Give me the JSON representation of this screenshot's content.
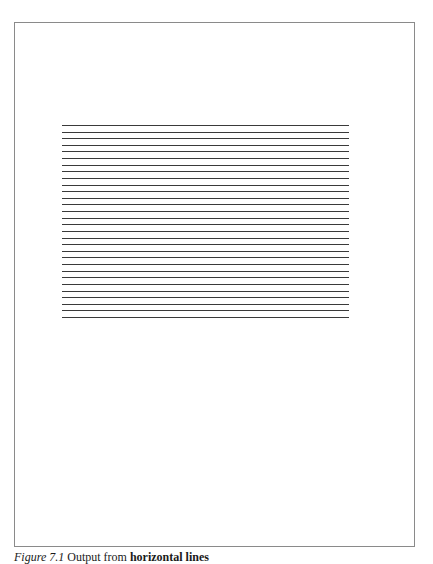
{
  "figure": {
    "frame": {
      "left": 14,
      "top": 22,
      "right": 415,
      "bottom": 547,
      "border_color": "#8a8a8a"
    },
    "lines": {
      "count": 30,
      "x_start": 62,
      "x_end": 349,
      "y_first": 125,
      "y_last": 317,
      "color": "#3a3a3a"
    },
    "caption": {
      "label": "Figure 7.1",
      "text": " Output from ",
      "code": "horizontal lines"
    }
  }
}
